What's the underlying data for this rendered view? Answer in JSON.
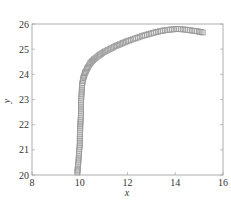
{
  "chart_data": {
    "type": "scatter",
    "title": "",
    "xlabel": "x",
    "ylabel": "y",
    "xlim": [
      8,
      16
    ],
    "ylim": [
      20,
      26
    ],
    "xticks": [
      8,
      10,
      12,
      14,
      16
    ],
    "yticks": [
      20,
      21,
      22,
      23,
      24,
      25,
      26
    ],
    "grid": false,
    "legend": null,
    "marker": "square",
    "color": "#999999",
    "series": [
      {
        "name": "trajectory",
        "x": [
          9.9,
          9.92,
          9.95,
          9.97,
          10.0,
          10.0,
          10.02,
          10.03,
          10.05,
          10.05,
          10.06,
          10.08,
          10.1,
          10.15,
          10.22,
          10.32,
          10.45,
          10.6,
          10.8,
          11.0,
          11.25,
          11.5,
          11.75,
          12.0,
          12.3,
          12.6,
          12.9,
          13.2,
          13.5,
          13.8,
          14.1,
          14.4,
          14.7,
          15.0,
          15.2
        ],
        "y": [
          20.1,
          20.3,
          20.6,
          20.9,
          21.2,
          21.5,
          21.8,
          22.1,
          22.4,
          22.7,
          23.0,
          23.3,
          23.6,
          23.85,
          24.05,
          24.25,
          24.45,
          24.6,
          24.75,
          24.88,
          25.0,
          25.12,
          25.22,
          25.32,
          25.42,
          25.52,
          25.6,
          25.68,
          25.74,
          25.78,
          25.8,
          25.78,
          25.74,
          25.7,
          25.65
        ]
      }
    ]
  }
}
